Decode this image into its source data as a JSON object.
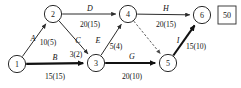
{
  "diagram": {
    "type": "project-network-activity-on-arrow",
    "total_value": "50",
    "nodes": [
      {
        "id": "1",
        "label": "1",
        "cx": 17,
        "cy": 64,
        "r": 8.6
      },
      {
        "id": "2",
        "label": "2",
        "cx": 53,
        "cy": 14,
        "r": 8.6
      },
      {
        "id": "3",
        "label": "3",
        "cx": 96,
        "cy": 63,
        "r": 8.6
      },
      {
        "id": "4",
        "label": "4",
        "cx": 128,
        "cy": 14,
        "r": 8.6
      },
      {
        "id": "5",
        "label": "5",
        "cx": 168,
        "cy": 63,
        "r": 8.6
      },
      {
        "id": "6",
        "label": "6",
        "cx": 202,
        "cy": 15,
        "r": 8.6
      }
    ],
    "edges": [
      {
        "id": "A",
        "name": "A",
        "value": "10(5)",
        "from": "1",
        "to": "2",
        "style": "solid",
        "critical": false,
        "name_x": 33,
        "name_y": 38,
        "val_x": 48,
        "val_y": 42
      },
      {
        "id": "B",
        "name": "B",
        "value": "15(15)",
        "from": "1",
        "to": "3",
        "style": "solid",
        "critical": true,
        "name_x": 55,
        "name_y": 57,
        "val_x": 55,
        "val_y": 76
      },
      {
        "id": "C",
        "name": "C",
        "value": "3(2)",
        "from": "2",
        "to": "3",
        "style": "solid",
        "critical": false,
        "name_x": 78,
        "name_y": 40,
        "val_x": 76,
        "val_y": 54
      },
      {
        "id": "D",
        "name": "D",
        "value": "20(15)",
        "from": "2",
        "to": "4",
        "style": "solid",
        "critical": false,
        "name_x": 90,
        "name_y": 8,
        "val_x": 90,
        "val_y": 24
      },
      {
        "id": "E",
        "name": "E",
        "value": "5(4)",
        "from": "3",
        "to": "4",
        "style": "solid",
        "critical": false,
        "name_x": 98,
        "name_y": 40,
        "val_x": 116,
        "val_y": 46
      },
      {
        "id": "F",
        "name": "",
        "value": "",
        "from": "4",
        "to": "5",
        "style": "dashed",
        "critical": false,
        "name_x": 152,
        "name_y": 36,
        "val_x": 152,
        "val_y": 36
      },
      {
        "id": "G",
        "name": "G",
        "value": "20(10)",
        "from": "3",
        "to": "5",
        "style": "solid",
        "critical": true,
        "name_x": 132,
        "name_y": 56,
        "val_x": 132,
        "val_y": 76
      },
      {
        "id": "H",
        "name": "H",
        "value": "20(15)",
        "from": "4",
        "to": "6",
        "style": "solid",
        "critical": false,
        "name_x": 166,
        "name_y": 8,
        "val_x": 166,
        "val_y": 24
      },
      {
        "id": "I",
        "name": "I",
        "value": "15(10)",
        "from": "5",
        "to": "6",
        "style": "solid",
        "critical": true,
        "name_x": 178,
        "name_y": 40,
        "val_x": 196,
        "val_y": 46
      }
    ]
  }
}
